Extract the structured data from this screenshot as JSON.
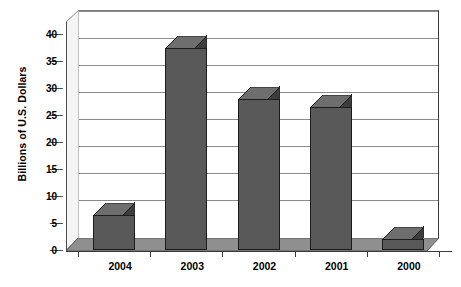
{
  "chart_data": {
    "type": "bar",
    "title": "",
    "subtitle": "",
    "xlabel": "",
    "ylabel": "Billions of U.S. Dollars",
    "categories": [
      "2004",
      "2003",
      "2002",
      "2001",
      "2000"
    ],
    "values": [
      6.5,
      37.5,
      28,
      26.5,
      2
    ],
    "series": [
      {
        "name": "Billions of U.S. Dollars",
        "values": [
          6.5,
          37.5,
          28,
          26.5,
          2
        ]
      }
    ],
    "ylim": [
      0,
      40
    ],
    "ytick_step": 5,
    "ytick_labels": [
      "0",
      "5",
      "10",
      "15",
      "20",
      "25",
      "30",
      "35",
      "40"
    ],
    "ytick_values": [
      0,
      5,
      10,
      15,
      20,
      25,
      30,
      35,
      40
    ],
    "grid": true,
    "grid_axis": "y",
    "legend": false,
    "legend_position": "none",
    "style": "3d-column",
    "annotations": []
  },
  "colors": {
    "bar_front": "#595959",
    "bar_top": "#6e6e6e",
    "bar_side": "#3d3d3d",
    "bar_outline": "#1c1c1c",
    "floor": "#8f8f8f",
    "side_wall": "#f2f2f2",
    "gridline": "#8a8a8a",
    "axis": "#3a3a3a",
    "plot_background": "#ffffff",
    "text": "#000000"
  }
}
